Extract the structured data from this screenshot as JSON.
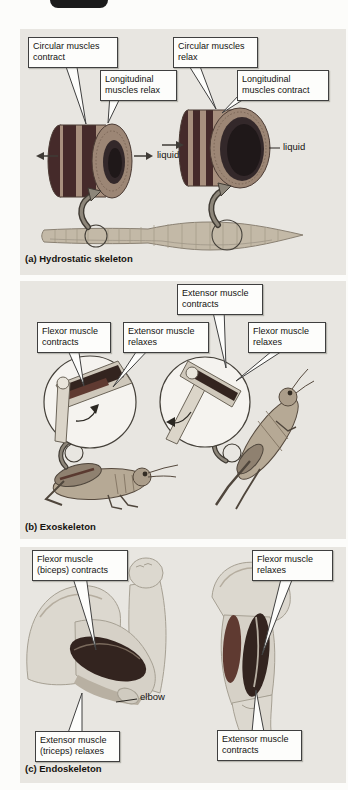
{
  "figure": {
    "top_button": {
      "color": "#1b1b1b"
    },
    "colors": {
      "page_bg": "#fcfcfa",
      "panel_bg": "#e8e6e1",
      "callout_bg": "#fdfdfb",
      "callout_border": "#3f3f3f",
      "muscle_dark": "#33241f",
      "muscle_mid": "#5f3a31",
      "cylinder_band_dark": "#452a2a",
      "cylinder_band_light": "#a8907e",
      "body_tan": "#c3b9a7"
    },
    "panels": {
      "a": {
        "caption": "(a) Hydrostatic skeleton",
        "callouts": {
          "circular_contract": "Circular muscles contract",
          "longitudinal_relax": "Longitudinal muscles relax",
          "circular_relax": "Circular muscles relax",
          "longitudinal_contract": "Longitudinal muscles contract"
        },
        "labels": {
          "liquid_left": "liquid",
          "liquid_right": "liquid"
        }
      },
      "b": {
        "caption": "(b) Exoskeleton",
        "callouts": {
          "extensor_contracts": "Extensor muscle contracts",
          "flexor_contracts": "Flexor muscle contracts",
          "extensor_relaxes": "Extensor muscle relaxes",
          "flexor_relaxes": "Flexor muscle relaxes"
        }
      },
      "c": {
        "caption": "(c) Endoskeleton",
        "callouts": {
          "flexor_biceps_contracts": "Flexor muscle (biceps) contracts",
          "flexor_relaxes": "Flexor muscle relaxes",
          "extensor_triceps_relaxes": "Extensor muscle (triceps) relaxes",
          "extensor_contracts": "Extensor muscle contracts"
        },
        "labels": {
          "elbow": "elbow"
        }
      }
    }
  }
}
